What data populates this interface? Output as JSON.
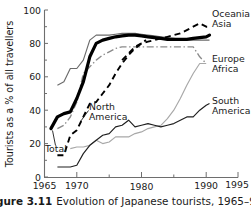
{
  "figure": {
    "caption_number": "Figure 3.11",
    "caption_text": "Evolution of Japanese tourists, 1965–91."
  },
  "chart_data": {
    "type": "line",
    "title": "",
    "xlabel": "",
    "ylabel": "Tourists as a % of all travellers",
    "xlim": [
      1965,
      1995
    ],
    "ylim": [
      0,
      100
    ],
    "xticks": [
      "1965",
      "1970",
      "1975",
      "1980",
      "1985",
      "1990",
      "1995"
    ],
    "xtick_values": [
      1965,
      1970,
      1975,
      1980,
      1985,
      1990,
      1995
    ],
    "xtick_labels_shown": [
      "1965",
      "1970",
      "1980",
      "1990",
      "1995"
    ],
    "yticks": [
      "0",
      "20",
      "40",
      "60",
      "80",
      "100"
    ],
    "ytick_values": [
      0,
      20,
      40,
      60,
      80,
      100
    ],
    "grid": false,
    "legend": "inline-labels",
    "series": [
      {
        "name": "Total",
        "label": "Total",
        "style": "thick-solid-black",
        "color": "#000000",
        "label_position": "inside-lower-left",
        "x": [
          1966,
          1967,
          1968,
          1969,
          1970,
          1971,
          1972,
          1973,
          1974,
          1975,
          1976,
          1977,
          1978,
          1979,
          1980,
          1981,
          1982,
          1983,
          1984,
          1985,
          1986,
          1987,
          1988,
          1989,
          1990,
          1991
        ],
        "values": [
          29,
          36,
          38,
          39,
          47,
          57,
          72,
          80,
          82,
          83,
          84,
          84.5,
          85,
          85,
          84.5,
          84,
          83.5,
          83,
          82.5,
          82.5,
          82.5,
          82.5,
          83,
          83.5,
          84,
          85
        ]
      },
      {
        "name": "Oceania",
        "label": "Oceania",
        "style": "dashed-black",
        "color": "#000000",
        "label_position": "right",
        "x": [
          1977,
          1978,
          1979,
          1980,
          1981,
          1982,
          1983,
          1984,
          1985,
          1986,
          1987,
          1988,
          1989,
          1990,
          1991
        ],
        "values": [
          70,
          74,
          78,
          80,
          81,
          82,
          83,
          84,
          85,
          86,
          88,
          90,
          92,
          90,
          90
        ]
      },
      {
        "name": "Asia",
        "label": "Asia",
        "style": "thin-solid-grey",
        "color": "#6b6b6b",
        "label_position": "right",
        "x": [
          1967,
          1968,
          1969,
          1970,
          1971,
          1972,
          1973,
          1974,
          1975,
          1976,
          1977,
          1978,
          1979,
          1980,
          1981,
          1982,
          1983,
          1984,
          1985,
          1986,
          1987,
          1988,
          1989,
          1990,
          1991
        ],
        "values": [
          55,
          57,
          62,
          62,
          70,
          82,
          85,
          85,
          85,
          85.5,
          86,
          86,
          86,
          85.5,
          85,
          84.5,
          84,
          83.5,
          83,
          82.5,
          82,
          82,
          82,
          82,
          82
        ]
      },
      {
        "name": "Europe",
        "label": "Europe",
        "style": "dash-dot-grey",
        "color": "#8a8a8a",
        "label_position": "right",
        "x": [
          1967,
          1968,
          1969,
          1970,
          1971,
          1972,
          1973,
          1974,
          1975,
          1976,
          1977,
          1978,
          1979,
          1980,
          1981,
          1982,
          1983,
          1984,
          1985,
          1986,
          1987,
          1988,
          1989,
          1990,
          1991
        ],
        "values": [
          29,
          31,
          36,
          45,
          62,
          66,
          70,
          73,
          75,
          77,
          78,
          78,
          78,
          78,
          78,
          78,
          78,
          78,
          78,
          78,
          78,
          78,
          78,
          72,
          68
        ]
      },
      {
        "name": "Africa",
        "label": "Africa",
        "style": "thin-solid-light-grey",
        "color": "#a8a8a8",
        "label_position": "right",
        "x": [
          1969,
          1970,
          1971,
          1972,
          1973,
          1974,
          1975,
          1976,
          1977,
          1978,
          1979,
          1980,
          1981,
          1982,
          1983,
          1984,
          1985,
          1986,
          1987,
          1988,
          1989,
          1990,
          1991
        ],
        "values": [
          17,
          18,
          18,
          19,
          22,
          20,
          21,
          24,
          24,
          24,
          26,
          27,
          29,
          30,
          31,
          32,
          35,
          40,
          47,
          55,
          62,
          68,
          57
        ]
      },
      {
        "name": "North America",
        "label": "North America",
        "style": "dashed-black",
        "color": "#000000",
        "label_position": "inside-middle",
        "x": [
          1967,
          1968,
          1969,
          1970,
          1971,
          1972,
          1973,
          1974,
          1975,
          1976,
          1977,
          1978,
          1979,
          1980,
          1981
        ],
        "values": [
          13,
          13,
          25,
          28,
          36,
          44,
          45,
          50,
          55,
          62,
          68,
          73,
          77,
          80,
          82
        ]
      },
      {
        "name": "South America",
        "label": "South America",
        "style": "thin-solid-dark",
        "color": "#1f1f1f",
        "label_position": "right",
        "x": [
          1967,
          1968,
          1969,
          1970,
          1971,
          1972,
          1973,
          1974,
          1975,
          1976,
          1977,
          1978,
          1979,
          1980,
          1981,
          1982,
          1983,
          1984,
          1985,
          1986,
          1987,
          1988,
          1989,
          1990,
          1991
        ],
        "values": [
          6,
          6,
          6,
          7,
          14,
          19,
          22,
          25,
          26,
          30,
          31,
          34,
          30,
          31,
          32,
          31,
          30,
          31,
          32,
          34,
          36,
          36,
          40,
          43,
          44
        ]
      }
    ],
    "annotations": [
      {
        "text": "Total",
        "x": 1966,
        "y": 22
      },
      {
        "text": "North America",
        "x": 1975,
        "y": 37
      }
    ]
  }
}
